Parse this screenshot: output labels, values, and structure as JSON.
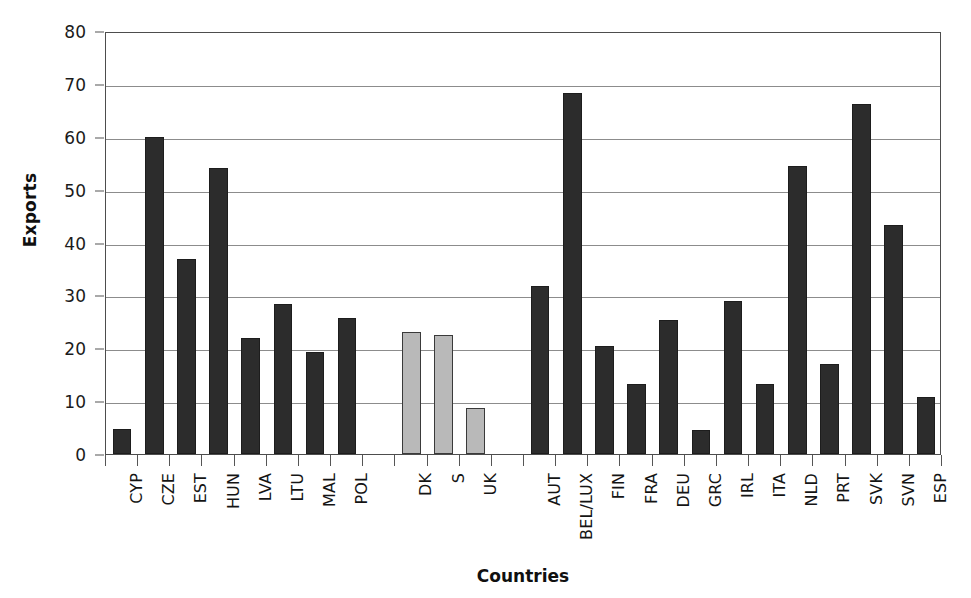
{
  "chart_data": {
    "type": "bar",
    "title": "",
    "xlabel": "Countries",
    "ylabel": "Exports",
    "ylim": [
      0,
      80
    ],
    "ytick_step": 10,
    "yticks": [
      0,
      10,
      20,
      30,
      40,
      50,
      60,
      70,
      80
    ],
    "grid": true,
    "legend": "none",
    "categories": [
      "CYP",
      "CZE",
      "EST",
      "HUN",
      "LVA",
      "LTU",
      "MAL",
      "POL",
      "",
      "DK",
      "S",
      "UK",
      "",
      "AUT",
      "BEL/LUX",
      "FIN",
      "FRA",
      "DEU",
      "GRC",
      "IRL",
      "ITA",
      "NLD",
      "PRT",
      "SVK",
      "SVN",
      "ESP"
    ],
    "values": [
      4.7,
      60.0,
      36.8,
      54.0,
      22.0,
      28.3,
      19.3,
      25.8,
      null,
      23.0,
      22.5,
      8.7,
      null,
      31.8,
      68.3,
      20.4,
      13.3,
      25.4,
      4.5,
      29.0,
      13.3,
      54.5,
      17.0,
      66.2,
      43.3,
      10.8
    ],
    "groups": [
      {
        "name": "new-member-states",
        "color": "#2c2c2c",
        "categories": [
          "CYP",
          "CZE",
          "EST",
          "HUN",
          "LVA",
          "LTU",
          "MAL",
          "POL"
        ],
        "values": [
          4.7,
          60.0,
          36.8,
          54.0,
          22.0,
          28.3,
          19.3,
          25.8
        ]
      },
      {
        "name": "non-euro-eu15",
        "color": "#b9b9b9",
        "categories": [
          "DK",
          "S",
          "UK"
        ],
        "values": [
          23.0,
          22.5,
          8.7
        ]
      },
      {
        "name": "euro-area",
        "color": "#2c2c2c",
        "categories": [
          "AUT",
          "BEL/LUX",
          "FIN",
          "FRA",
          "DEU",
          "GRC",
          "IRL",
          "ITA",
          "NLD",
          "PRT",
          "SVK",
          "SVN",
          "ESP"
        ],
        "values": [
          31.8,
          68.3,
          20.4,
          13.3,
          25.4,
          4.5,
          29.0,
          13.3,
          54.5,
          17.0,
          66.2,
          43.3,
          10.8
        ]
      }
    ],
    "colors": {
      "dark_bar": "#2c2c2c",
      "light_bar": "#b9b9b9",
      "gridline": "#8c8c8c",
      "axis": "#4d4d4d",
      "text": "#141414",
      "background": "#ffffff"
    }
  }
}
